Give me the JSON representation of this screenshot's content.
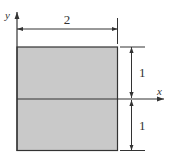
{
  "diagram": {
    "type": "cross-section",
    "shape": "rectangle",
    "fill_color": "#c8c8c8",
    "stroke_color": "#333333",
    "axes": {
      "x_label": "x",
      "y_label": "y"
    },
    "dimensions": {
      "width_label": "2",
      "upper_height_label": "1",
      "lower_height_label": "1"
    }
  }
}
